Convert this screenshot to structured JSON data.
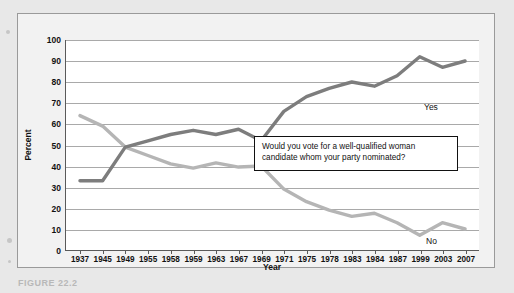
{
  "figure": {
    "caption": "FIGURE 22.2"
  },
  "annotation": {
    "text": "Would you vote for a well-qualified woman candidate whom your party nominated?"
  },
  "colors": {
    "yes_line": "#7d7d7d",
    "no_line": "#b5b5b5",
    "gridline": "#a9a9a9",
    "axis": "#5a5a5a",
    "panel_background": "#f2f2f2",
    "plot_background": "#ffffff",
    "page_background": "#e8e8e8",
    "text": "#111111"
  },
  "chart_data": {
    "type": "line",
    "title": "",
    "xlabel": "Year",
    "ylabel": "Percent",
    "ylim": [
      0,
      100
    ],
    "ytick_step": 10,
    "yticks": [
      0,
      10,
      20,
      30,
      40,
      50,
      60,
      70,
      80,
      90,
      100
    ],
    "grid": true,
    "legend": "inline-end-labels",
    "categories": [
      "1937",
      "1945",
      "1949",
      "1955",
      "1958",
      "1959",
      "1963",
      "1967",
      "1969",
      "1971",
      "1975",
      "1978",
      "1983",
      "1984",
      "1987",
      "1999",
      "2003",
      "2007"
    ],
    "series": [
      {
        "name": "Yes",
        "color": "#7d7d7d",
        "values": [
          33,
          33,
          49,
          52,
          55,
          57,
          55,
          57.5,
          52,
          66,
          73,
          77,
          80,
          78,
          83,
          92,
          87,
          90
        ]
      },
      {
        "name": "No",
        "color": "#b5b5b5",
        "values": [
          64,
          59,
          49,
          45,
          41,
          39,
          41.5,
          39.5,
          40,
          29,
          23,
          19,
          16,
          17.5,
          13,
          7,
          13,
          10
        ]
      }
    ]
  }
}
